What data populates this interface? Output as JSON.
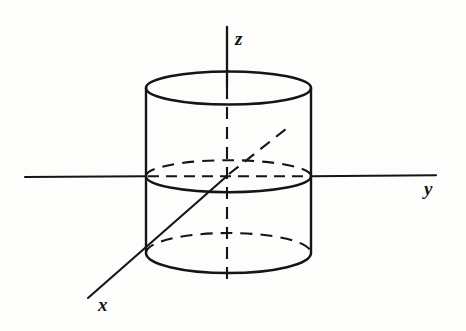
{
  "figure": {
    "title": "",
    "kind": "3d-coordinate-axes-with-cylinder",
    "background_color": "#fdfdfc",
    "stroke_color": "#151515",
    "labels": {
      "x_axis": "x",
      "y_axis": "y",
      "z_axis": "z"
    },
    "label_positions": {
      "x": {
        "x": 104,
        "y": 308
      },
      "y": {
        "x": 424,
        "y": 195
      },
      "z": {
        "x": 235,
        "y": 45
      }
    },
    "axes": [
      {
        "name": "z-axis",
        "style": "solid-upper-dashed-lower",
        "solid_from": {
          "x": 227,
          "y": 27
        },
        "solid_to": {
          "x": 227,
          "y": 88
        },
        "dashed_from": {
          "x": 227,
          "y": 88
        },
        "dashed_to": {
          "x": 227,
          "y": 287
        }
      },
      {
        "name": "y-axis",
        "style": "solid-with-dashed-interior",
        "from": {
          "x": 25,
          "y": 176
        },
        "to": {
          "x": 436,
          "y": 176
        },
        "dashed_segment": {
          "from_x": 146,
          "to_x": 311
        }
      },
      {
        "name": "x-axis",
        "style": "solid-lower-dashed-upper",
        "solid_from": {
          "x": 89,
          "y": 297
        },
        "solid_to": {
          "x": 227,
          "y": 176
        },
        "dashed_from": {
          "x": 227,
          "y": 176
        },
        "dashed_to": {
          "x": 290,
          "y": 126
        }
      }
    ],
    "cylinder": {
      "name": "vertical-circular-cylinder",
      "center_x": 228.5,
      "radius_x": 82.5,
      "radius_y": 16,
      "top_center_y": 88,
      "bottom_center_y": 253,
      "bottom_radius_y": 19,
      "left_wall_x": 146,
      "right_wall_x": 311,
      "ellipses": [
        {
          "name": "top-rim",
          "center_y": 88,
          "back_half": "solid",
          "front_half": "solid"
        },
        {
          "name": "mid-trace-xy-plane",
          "center_y": 176,
          "back_half": "dashed",
          "front_half": "solid"
        },
        {
          "name": "bottom-rim",
          "center_y": 253,
          "back_half": "dashed",
          "front_half": "solid"
        }
      ]
    }
  }
}
